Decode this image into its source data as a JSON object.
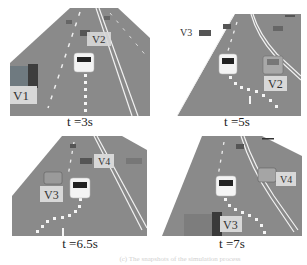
{
  "figure": {
    "panels": [
      {
        "id": "p1",
        "time_label": "t =3s",
        "vehicles": [
          "V1",
          "V2"
        ]
      },
      {
        "id": "p2",
        "time_label": "t =5s",
        "vehicles": [
          "V3",
          "V2"
        ]
      },
      {
        "id": "p3",
        "time_label": "t =6.5s",
        "vehicles": [
          "V3",
          "V4"
        ]
      },
      {
        "id": "p4",
        "time_label": "t =7s",
        "vehicles": [
          "V4",
          "V3"
        ]
      }
    ],
    "caption": "(c) The snapshots of the simulation process"
  },
  "colors": {
    "road": "#8a8a8a",
    "road_dark": "#7a7a7a",
    "lane_marking": "#f2f2f2",
    "label_box": "#d8d8d8",
    "ego_car": "#f4f4f4"
  }
}
